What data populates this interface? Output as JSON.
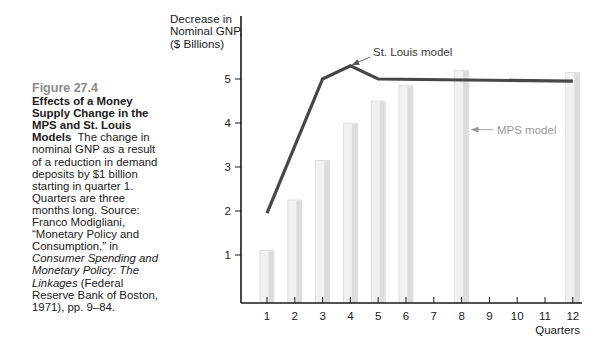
{
  "caption": {
    "figure_number": "Figure 27.4",
    "title": "Effects of a Money Supply Change in the MPS and St. Louis Models",
    "body_plain": "The change in nominal GNP as a result of a reduction in demand deposits by $1 billion starting in quarter 1. Quarters are three months long. Source: Franco Modigliani, “Monetary Policy and Consumption,” in",
    "body_italic": "Consumer Spending and Monetary Policy: The Linkages",
    "body_tail": "(Federal Reserve Bank of Boston, 1971), pp. 9–84."
  },
  "colors": {
    "line": "#474747",
    "bar_light": "#f1f1f1",
    "bar_shade": "#dcdcdc",
    "bar_edge": "#cfcfcf",
    "axis": "#1a1a1a",
    "mps_annotation": "#9a9a9a",
    "stlouis_annotation": "#555555",
    "figure_number": "#8a8a8a"
  },
  "chart_data": {
    "type": "bar+line",
    "title": "Effects of a Money Supply Change in the MPS and St. Louis Models",
    "xlabel": "Quarters",
    "ylabel": "Decrease in Nominal GNP, ($ Billions)",
    "ylabel_lines": [
      "Decrease in",
      "Nominal GNP,",
      "($ Billions)"
    ],
    "x_ticks": [
      1,
      2,
      3,
      4,
      5,
      6,
      7,
      8,
      9,
      10,
      11,
      12
    ],
    "y_ticks": [
      1,
      2,
      3,
      4,
      5
    ],
    "ylim": [
      0,
      6.5
    ],
    "xlim": [
      0,
      12.3
    ],
    "grid": false,
    "legend": "inline annotations with arrows",
    "series": [
      {
        "name": "MPS model",
        "type": "bar",
        "x": [
          1,
          2,
          3,
          4,
          5,
          6,
          8,
          12
        ],
        "values": [
          1.1,
          2.25,
          3.15,
          4.0,
          4.5,
          4.85,
          5.2,
          5.15
        ]
      },
      {
        "name": "St. Louis model",
        "type": "line",
        "x": [
          1,
          3,
          4,
          5,
          12
        ],
        "values": [
          1.95,
          5.0,
          5.3,
          5.0,
          4.95
        ]
      }
    ],
    "annotations": [
      {
        "text": "St. Louis model",
        "points_to": {
          "x": 4,
          "y": 5.3
        }
      },
      {
        "text": "MPS model",
        "points_to": {
          "x": 8,
          "y": 3.85
        }
      }
    ]
  }
}
